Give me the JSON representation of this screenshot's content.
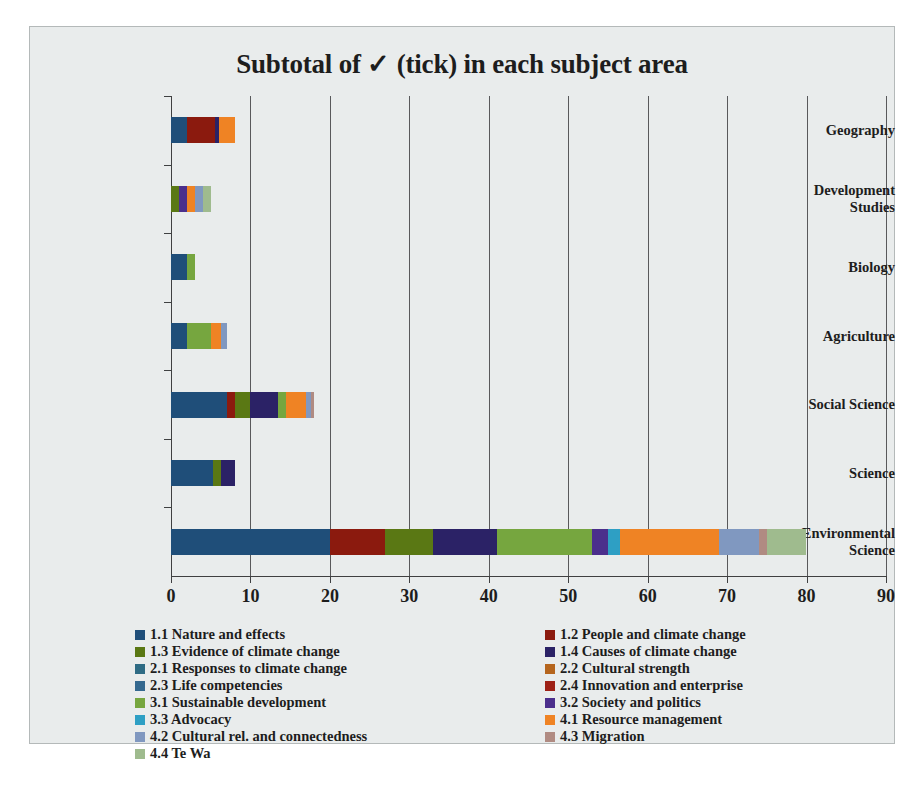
{
  "chart_data": {
    "type": "bar",
    "orientation": "horizontal",
    "stacked": true,
    "title": "Subtotal of ✓ (tick) in each subject area",
    "xlabel": "",
    "ylabel": "",
    "xlim": [
      0,
      90
    ],
    "xticks": [
      0,
      10,
      20,
      30,
      40,
      50,
      60,
      70,
      80,
      90
    ],
    "grid": "vertical",
    "legend_position": "bottom",
    "legend_columns": 2,
    "categories": [
      "Geography",
      "Development Studies",
      "Biology",
      "Agriculture",
      "Social Science",
      "Science",
      "Environmental Science"
    ],
    "series": [
      {
        "name": "1.1 Nature and effects",
        "color": "#1f4e79",
        "values": [
          2,
          0,
          2,
          2,
          7,
          5.3,
          20
        ]
      },
      {
        "name": "1.2 People and climate change",
        "color": "#8b1a0e",
        "values": [
          3.5,
          0,
          0,
          0,
          1,
          0,
          7
        ]
      },
      {
        "name": "1.3 Evidence of climate change",
        "color": "#5a7814",
        "values": [
          0,
          1,
          0,
          0,
          2,
          1,
          6
        ]
      },
      {
        "name": "1.4 Causes of climate change",
        "color": "#2b2266",
        "values": [
          0.6,
          0,
          0,
          0,
          3.5,
          1.7,
          8
        ]
      },
      {
        "name": "2.1 Responses to climate change",
        "color": "#2e6b84",
        "values": [
          0,
          0,
          0,
          0,
          0,
          0,
          0
        ]
      },
      {
        "name": "2.2 Cultural strength",
        "color": "#b5651d",
        "values": [
          0,
          0,
          0,
          0,
          0,
          0,
          0
        ]
      },
      {
        "name": "2.3 Life competencies",
        "color": "#34698f",
        "values": [
          0,
          0,
          0,
          0,
          0,
          0,
          0
        ]
      },
      {
        "name": "2.4 Innovation and enterprise",
        "color": "#9d2116",
        "values": [
          0,
          0,
          0,
          0,
          0,
          0,
          0
        ]
      },
      {
        "name": "3.1 Sustainable development",
        "color": "#76a63f",
        "values": [
          0,
          0,
          1,
          3,
          1,
          0,
          12
        ]
      },
      {
        "name": "3.2 Society and politics",
        "color": "#4b2f8c",
        "values": [
          0,
          1,
          0,
          0,
          0,
          0,
          2
        ]
      },
      {
        "name": "3.3 Advocacy",
        "color": "#2e9fc4",
        "values": [
          0,
          0,
          0,
          0,
          0,
          0,
          1.5
        ]
      },
      {
        "name": "4.1 Resource management",
        "color": "#ef8324",
        "values": [
          2,
          1,
          0,
          1.3,
          2.5,
          0,
          12.5
        ]
      },
      {
        "name": "4.2 Cultural rel. and connectedness",
        "color": "#8098c0",
        "values": [
          0,
          1,
          0,
          0.7,
          0.6,
          0,
          5
        ]
      },
      {
        "name": "4.3 Migration",
        "color": "#b08b82",
        "values": [
          0,
          0,
          0,
          0,
          0.4,
          0,
          1
        ]
      },
      {
        "name": "4.4 Te Wa",
        "color": "#9fbb8e",
        "values": [
          0,
          1,
          0,
          0,
          0,
          0,
          5
        ]
      }
    ],
    "totals": [
      8.1,
      5,
      3,
      7,
      18,
      8,
      80
    ],
    "legend_left": [
      "1.1 Nature and effects",
      "1.3 Evidence of climate change",
      "2.1 Responses to climate change",
      "2.3 Life competencies",
      "3.1 Sustainable development",
      "3.3 Advocacy",
      "4.2 Cultural rel. and connectedness",
      "4.4 Te Wa"
    ],
    "legend_right": [
      "1.2 People and climate change",
      "1.4 Causes of climate change",
      "2.2 Cultural strength",
      "2.4 Innovation and enterprise",
      "3.2 Society and politics",
      "4.1 Resource management",
      "4.3 Migration"
    ]
  },
  "caption": {
    "text": ""
  },
  "colors": {
    "plot_background": "#e9ecec",
    "grid": "#59595b",
    "axis": "#3f4041",
    "text": "#1d1d1d"
  }
}
